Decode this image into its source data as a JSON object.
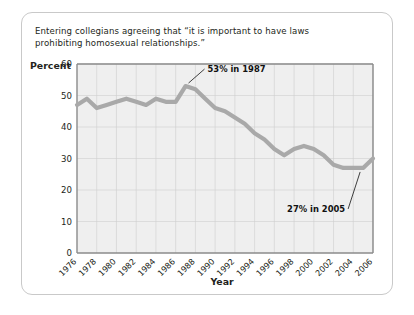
{
  "card": {
    "caption_line1": "Entering collegians agreeing that “it is important to have laws",
    "caption_line2": "prohibiting homosexual relationships.”",
    "border_color": "#c9c9c9",
    "background_color": "#ffffff"
  },
  "chart_data": {
    "type": "line",
    "title": "Entering collegians agreeing that “it is important to have laws prohibiting homosexual relationships.”",
    "xlabel": "Year",
    "ylabel": "Percent",
    "ylim": [
      0,
      60
    ],
    "xlim": [
      1976,
      2006
    ],
    "grid": true,
    "legend": "none",
    "line_color": "#a9a9a9",
    "plot_background": "#efefef",
    "gridline_color": "#cfcfcf",
    "ytick_labels": [
      "60",
      "50",
      "40",
      "30",
      "20",
      "10",
      "0"
    ],
    "ytick_values": [
      60,
      50,
      40,
      30,
      20,
      10,
      0
    ],
    "xtick_labels": [
      "1976",
      "1978",
      "1980",
      "1982",
      "1984",
      "1986",
      "1988",
      "1990",
      "1992",
      "1994",
      "1996",
      "1998",
      "2000",
      "2002",
      "2004",
      "2006"
    ],
    "xtick_values": [
      1976,
      1978,
      1980,
      1982,
      1984,
      1986,
      1988,
      1990,
      1992,
      1994,
      1996,
      1998,
      2000,
      2002,
      2004,
      2006
    ],
    "x": [
      1976,
      1977,
      1978,
      1979,
      1980,
      1981,
      1982,
      1983,
      1984,
      1985,
      1986,
      1987,
      1988,
      1989,
      1990,
      1991,
      1992,
      1993,
      1994,
      1995,
      1996,
      1997,
      1998,
      1999,
      2000,
      2001,
      2002,
      2003,
      2004,
      2005,
      2006
    ],
    "values": [
      47,
      49,
      46,
      47,
      48,
      49,
      48,
      47,
      49,
      48,
      48,
      53,
      52,
      49,
      46,
      45,
      43,
      41,
      38,
      36,
      33,
      31,
      33,
      34,
      33,
      31,
      28,
      27,
      27,
      27,
      30
    ],
    "annotations": [
      {
        "label": "53% in 1987",
        "x": 1987,
        "y": 53
      },
      {
        "label": "27% in 2005",
        "x": 2005,
        "y": 27
      }
    ]
  }
}
